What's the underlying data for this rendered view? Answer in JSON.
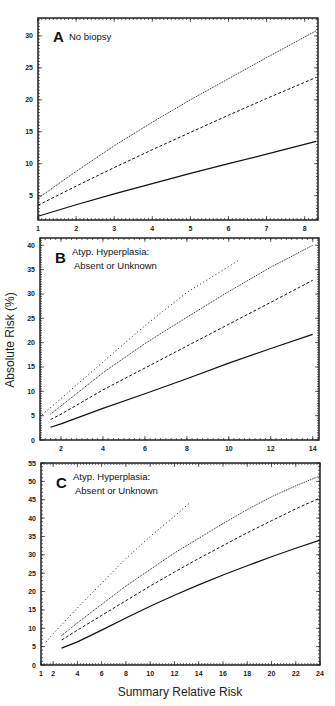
{
  "figure": {
    "ylabel": "Absolute Risk (%)",
    "xlabel": "Summary Relative Risk"
  },
  "chart_data": [
    {
      "type": "line",
      "panel": "A",
      "title": "No biopsy",
      "xlabel": "Summary Relative Risk",
      "ylabel": "Absolute Risk (%)",
      "xlim": [
        1,
        8.35
      ],
      "ylim": [
        1.2,
        32.8
      ],
      "xticks": [
        1,
        2,
        3,
        4,
        5,
        6,
        7,
        8
      ],
      "yticks": [
        5,
        10,
        15,
        20,
        25,
        30
      ],
      "grid": false,
      "legend": "none",
      "series": [
        {
          "name": "dotted (dense)",
          "style": "dotted-dense",
          "x": [
            1,
            2,
            3,
            4,
            5,
            6,
            7,
            8.3
          ],
          "y": [
            4.6,
            8.8,
            12.8,
            16.5,
            20.0,
            23.3,
            26.6,
            30.8
          ]
        },
        {
          "name": "dashed",
          "style": "dashed",
          "x": [
            1,
            2,
            3,
            4,
            5,
            6,
            7,
            8.3
          ],
          "y": [
            3.5,
            6.5,
            9.4,
            12.2,
            14.9,
            17.6,
            20.2,
            23.5
          ]
        },
        {
          "name": "solid",
          "style": "solid",
          "x": [
            1,
            2,
            3,
            4,
            5,
            6,
            7,
            8.3
          ],
          "y": [
            1.8,
            3.6,
            5.3,
            6.9,
            8.5,
            10.0,
            11.5,
            13.5
          ]
        }
      ]
    },
    {
      "type": "line",
      "panel": "B",
      "title": "Atyp. Hyperplasia: Absent or Unknown",
      "title_lines": [
        "Atyp. Hyperplasia:",
        "Absent or Unknown"
      ],
      "xlabel": "Summary Relative Risk",
      "ylabel": "Absolute Risk (%)",
      "xlim": [
        1,
        14.3
      ],
      "ylim": [
        0,
        41.5
      ],
      "xticks": [
        2,
        4,
        6,
        8,
        10,
        12,
        14
      ],
      "yticks": [
        0,
        5,
        10,
        15,
        20,
        25,
        30,
        35,
        40
      ],
      "grid": false,
      "legend": "none",
      "series": [
        {
          "name": "dotted (sparse)",
          "style": "dotted-sparse",
          "x": [
            1.1,
            2,
            4,
            6,
            8,
            10.5
          ],
          "y": [
            5.2,
            8.5,
            16.0,
            23.5,
            30.3,
            37.0
          ]
        },
        {
          "name": "dotted (dense)",
          "style": "dotted-dense",
          "x": [
            1.5,
            2,
            4,
            6,
            8,
            10,
            12,
            14
          ],
          "y": [
            5.3,
            7.0,
            13.8,
            19.8,
            25.2,
            30.5,
            35.5,
            40.0
          ]
        },
        {
          "name": "dashed",
          "style": "dashed",
          "x": [
            1.5,
            2,
            4,
            6,
            8,
            10,
            12,
            14
          ],
          "y": [
            4.2,
            5.3,
            10.3,
            14.8,
            19.3,
            23.8,
            28.3,
            32.8
          ]
        },
        {
          "name": "solid",
          "style": "solid",
          "x": [
            1.5,
            2,
            4,
            6,
            8,
            10,
            12,
            14
          ],
          "y": [
            2.6,
            3.3,
            6.5,
            9.5,
            12.6,
            15.8,
            18.8,
            21.7
          ]
        }
      ]
    },
    {
      "type": "line",
      "panel": "C",
      "title": "Atyp. Hyperplasia: Absent or Unknown",
      "title_lines": [
        "Atyp. Hyperplasia:",
        "Absent or Unknown"
      ],
      "xlabel": "Summary Relative Risk",
      "ylabel": "Absolute Risk (%)",
      "xlim": [
        1,
        24
      ],
      "ylim": [
        0,
        55
      ],
      "xticks": [
        1,
        2,
        4,
        6,
        8,
        10,
        12,
        14,
        16,
        18,
        20,
        22,
        24
      ],
      "yticks": [
        0,
        5,
        10,
        15,
        20,
        25,
        30,
        35,
        40,
        45,
        50,
        55
      ],
      "grid": false,
      "legend": "none",
      "series": [
        {
          "name": "dotted (sparse)",
          "style": "dotted-sparse",
          "x": [
            1.4,
            2,
            4,
            6,
            8,
            10,
            12,
            13.2
          ],
          "y": [
            6.2,
            8.5,
            15.5,
            22.3,
            29.0,
            35.0,
            40.5,
            44.0
          ]
        },
        {
          "name": "dotted (dense)",
          "style": "dotted-dense",
          "x": [
            2.7,
            4,
            6,
            8,
            10,
            12,
            14,
            16,
            18,
            20,
            22,
            24
          ],
          "y": [
            8.0,
            11.5,
            16.5,
            21.5,
            26.0,
            30.5,
            34.5,
            38.5,
            42.3,
            45.8,
            48.8,
            51.5
          ]
        },
        {
          "name": "dashed",
          "style": "dashed",
          "x": [
            2.7,
            4,
            6,
            8,
            10,
            12,
            14,
            16,
            18,
            20,
            22,
            24
          ],
          "y": [
            6.8,
            9.5,
            13.5,
            17.5,
            21.5,
            25.3,
            29.0,
            32.5,
            36.0,
            39.3,
            42.5,
            45.5
          ]
        },
        {
          "name": "solid",
          "style": "solid",
          "x": [
            2.7,
            4,
            6,
            8,
            10,
            12,
            14,
            16,
            18,
            20,
            22,
            24
          ],
          "y": [
            4.6,
            6.3,
            9.5,
            12.8,
            16.0,
            19.0,
            21.8,
            24.5,
            27.0,
            29.5,
            31.8,
            34.0
          ]
        }
      ]
    }
  ]
}
